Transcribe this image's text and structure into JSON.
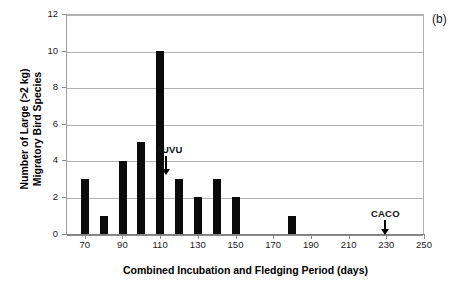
{
  "figure": {
    "panel_letter": "(b)",
    "xlabel": "Combined Incubation and Fledging Period (days)",
    "ylabel_line1": "Number of Large (>2 kg)",
    "ylabel_line2": "Migratory Bird Species",
    "bar_color": "#0a0a0a",
    "grid_color": "#b3b3b3",
    "axis_color": "#8a8a8a"
  },
  "chart_data": {
    "type": "bar",
    "title": "",
    "subtitle": "",
    "xlabel": "Combined Incubation and Fledging Period (days)",
    "ylabel": "Number of Large (>2 kg) Migratory Bird Species",
    "xlim": [
      60,
      250
    ],
    "ylim": [
      0,
      12
    ],
    "xticks": [
      70,
      90,
      110,
      130,
      150,
      170,
      190,
      210,
      230,
      250
    ],
    "xtick_labels": [
      "70",
      "90",
      "110",
      "130",
      "150",
      "170",
      "190",
      "210",
      "230",
      "250"
    ],
    "yticks": [
      0,
      2,
      4,
      6,
      8,
      10,
      12
    ],
    "ytick_labels": [
      "0",
      "2",
      "4",
      "6",
      "8",
      "10",
      "12"
    ],
    "grid": "horizontal",
    "legend": "none",
    "bin_width": 10,
    "x": [
      70,
      80,
      90,
      100,
      110,
      120,
      130,
      140,
      150,
      180
    ],
    "values": [
      3,
      1,
      4,
      5,
      10,
      3,
      2,
      3,
      2,
      1
    ],
    "bars": [
      {
        "x": 70,
        "value": 3
      },
      {
        "x": 80,
        "value": 1
      },
      {
        "x": 90,
        "value": 4
      },
      {
        "x": 100,
        "value": 5
      },
      {
        "x": 110,
        "value": 10
      },
      {
        "x": 120,
        "value": 3
      },
      {
        "x": 130,
        "value": 2
      },
      {
        "x": 140,
        "value": 3
      },
      {
        "x": 150,
        "value": 2
      },
      {
        "x": 180,
        "value": 1
      }
    ],
    "annotations": [
      {
        "text": "TUVU",
        "x": 120,
        "y": 3,
        "arrow": "down"
      },
      {
        "text": "CACO",
        "x": 240,
        "y": 0,
        "arrow": "down"
      }
    ]
  }
}
